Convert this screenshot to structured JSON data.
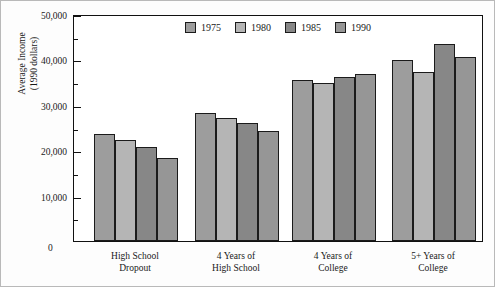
{
  "chart_data": {
    "type": "bar",
    "title": "",
    "xlabel": "",
    "ylabel": "Average Income\n(1990 dollars)",
    "ylabel_line1": "Average Income",
    "ylabel_line2": "(1990 dollars)",
    "categories": [
      "High School Dropout",
      "4 Years of High School",
      "4 Years of College",
      "5+ Years of College"
    ],
    "category_lines": [
      [
        "High School",
        "Dropout"
      ],
      [
        "4 Years of",
        "High School"
      ],
      [
        "4 Years of",
        "College"
      ],
      [
        "5+ Years of",
        "College"
      ]
    ],
    "series": [
      {
        "name": "1975",
        "color": "#9d9d9d",
        "values": [
          23500,
          28200,
          35500,
          39800
        ]
      },
      {
        "name": "1980",
        "color": "#b5b5b5",
        "values": [
          22200,
          27200,
          34700,
          37300
        ]
      },
      {
        "name": "1985",
        "color": "#878787",
        "values": [
          20700,
          26000,
          36200,
          43300
        ]
      },
      {
        "name": "1990",
        "color": "#969696",
        "values": [
          18300,
          24300,
          36800,
          40500
        ]
      }
    ],
    "ylim": [
      0,
      50000
    ],
    "y_major_ticks": [
      0,
      10000,
      20000,
      30000,
      40000,
      50000
    ],
    "y_major_tick_labels": [
      "0",
      "10,000",
      "20,000",
      "30,000",
      "40,000",
      "50,000"
    ],
    "y_minor_ticks": [
      5000,
      15000,
      25000,
      35000,
      45000
    ],
    "grid": false,
    "legend_position": "top-center",
    "legend_entries": [
      "1975",
      "1980",
      "1985",
      "1990"
    ]
  }
}
